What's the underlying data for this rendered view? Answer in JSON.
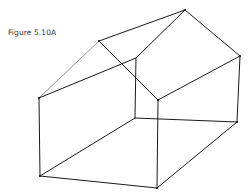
{
  "figure": {
    "caption": "Figure 5.10A",
    "stroke_color": "#1a1a1a",
    "vertices": {
      "ridge_front": [
        99,
        41
      ],
      "ridge_back": [
        185,
        10
      ],
      "eave_front_left": [
        39,
        98
      ],
      "eave_front_right": [
        158,
        100
      ],
      "eave_back_right": [
        240,
        56
      ],
      "eave_back_left": [
        136,
        58
      ],
      "base_front_left": [
        40,
        176
      ],
      "base_front_right": [
        157,
        188
      ],
      "base_back_right": [
        237,
        122
      ],
      "base_back_left": [
        135,
        118
      ]
    }
  }
}
